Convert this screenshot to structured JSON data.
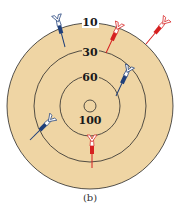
{
  "figure": {
    "caption": "(b)",
    "board_color": "#efd5a4",
    "ring_line_color": "#2a2a2a"
  },
  "rings": [
    {
      "label": "10",
      "radius": 83
    },
    {
      "label": "30",
      "radius": 56
    },
    {
      "label": "60",
      "radius": 30
    },
    {
      "label": "100",
      "radius": 6
    }
  ],
  "darts": [
    {
      "color": "blue",
      "hex": "#1f3f7a",
      "position": "outer edge top-left"
    },
    {
      "color": "red",
      "hex": "#d62020",
      "position": "ring 10 top"
    },
    {
      "color": "red",
      "hex": "#d62020",
      "position": "outside board top-right"
    },
    {
      "color": "blue",
      "hex": "#1f3f7a",
      "position": "ring 30 right"
    },
    {
      "color": "blue",
      "hex": "#1f3f7a",
      "position": "ring 30 left"
    },
    {
      "color": "red",
      "hex": "#d62020",
      "position": "ring 60 bottom"
    }
  ]
}
